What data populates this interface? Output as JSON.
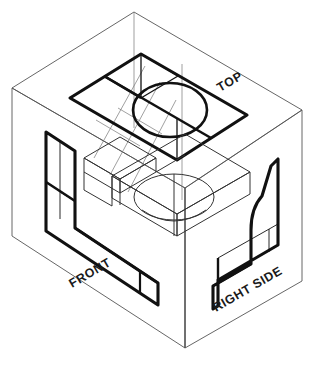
{
  "figure": {
    "kind": "orthographic-glass-box-projection",
    "title_visible": false,
    "background_color": "#ffffff",
    "line_color": "#111111",
    "thin_line_color": "#555555"
  },
  "labels": {
    "top": "TOP",
    "front": "FRONT",
    "right_side": "RIGHT SIDE"
  },
  "views": {
    "top_view": {
      "name": "TOP",
      "contains_circle": true,
      "circle_count": 1,
      "outline": "rectangle"
    },
    "front_view": {
      "name": "FRONT",
      "outline": "L-shaped profile"
    },
    "right_side_view": {
      "name": "RIGHT SIDE",
      "outline": "angled profile with fillet"
    }
  },
  "object": {
    "name": "machined block with through hole",
    "features": [
      "step",
      "through-hole",
      "angled face"
    ]
  },
  "geometry": {
    "box": {
      "top_apex": [
        134,
        12
      ],
      "left_top": [
        12,
        88
      ],
      "right_top": [
        302,
        110
      ],
      "center_top": [
        185,
        188
      ],
      "left_bottom": [
        12,
        236
      ],
      "right_bottom": [
        302,
        281
      ],
      "bottom_vertex": [
        185,
        348
      ]
    }
  }
}
